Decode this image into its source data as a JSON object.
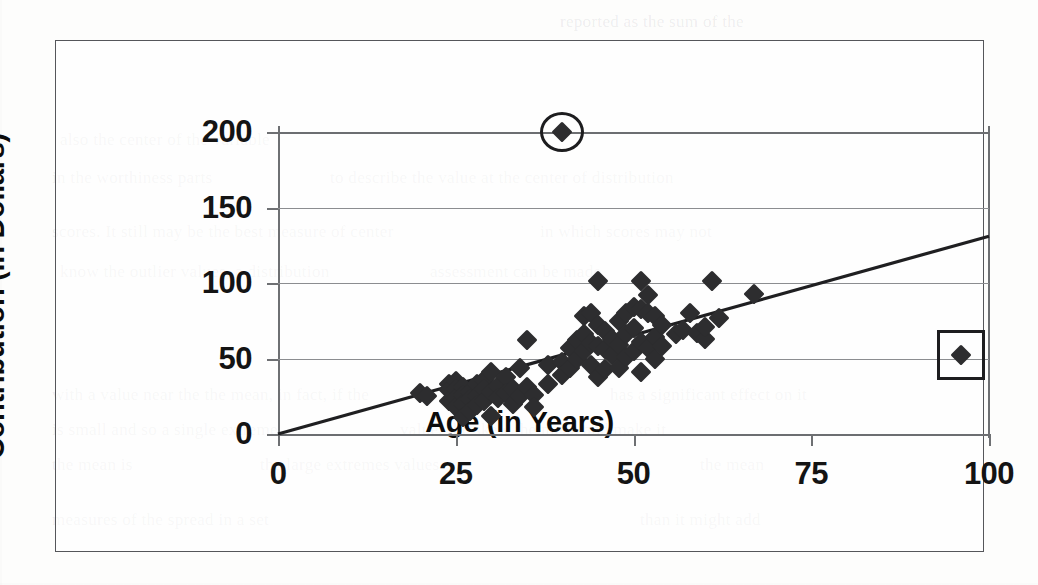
{
  "figure": {
    "frame_color": "#55565a",
    "background_color": "#fdfdfc"
  },
  "ghost_text": [
    {
      "text": "reported as the sum of the",
      "x": 560,
      "y": 12
    },
    {
      "text": "also the center of the variable",
      "x": 60,
      "y": 130
    },
    {
      "text": "in the worthiness parts",
      "x": 52,
      "y": 168
    },
    {
      "text": "to describe the value at the center of distribution",
      "x": 330,
      "y": 168
    },
    {
      "text": "scores. It still may be the best measure of center",
      "x": 52,
      "y": 222
    },
    {
      "text": "in which scores may not",
      "x": 540,
      "y": 222
    },
    {
      "text": "know the outlier values, a distribution",
      "x": 60,
      "y": 262
    },
    {
      "text": "assessment can be made",
      "x": 430,
      "y": 262
    },
    {
      "text": "with a value near the the mean, in fact, if the",
      "x": 52,
      "y": 385
    },
    {
      "text": "has a significant effect on it",
      "x": 610,
      "y": 385
    },
    {
      "text": "is small and so a single extreme",
      "x": 52,
      "y": 420
    },
    {
      "text": "value; the skew the mean and make it",
      "x": 400,
      "y": 420
    },
    {
      "text": "the mean is",
      "x": 52,
      "y": 455
    },
    {
      "text": "the large extremes values",
      "x": 260,
      "y": 455
    },
    {
      "text": "the mean",
      "x": 700,
      "y": 455
    },
    {
      "text": "measures of the spread in a set",
      "x": 52,
      "y": 510
    },
    {
      "text": "than it might add",
      "x": 640,
      "y": 510
    }
  ],
  "chart_data": {
    "type": "scatter",
    "title": "",
    "xlabel": "Age (in Years)",
    "ylabel": "Contribution (in Dollars)",
    "xlim": [
      0,
      100
    ],
    "ylim": [
      0,
      200
    ],
    "xticks": [
      0,
      25,
      50,
      75,
      100
    ],
    "yticks": [
      0,
      50,
      100,
      150,
      200
    ],
    "xtick_labels": [
      "0",
      "25",
      "50",
      "75",
      "100"
    ],
    "ytick_labels": [
      "0",
      "50",
      "100",
      "150",
      "200"
    ],
    "grid": "horizontal",
    "legend": "none",
    "marker": "diamond",
    "marker_color": "#2d2d2f",
    "points": [
      [
        20,
        27
      ],
      [
        21,
        25
      ],
      [
        24,
        33
      ],
      [
        24,
        29
      ],
      [
        24,
        22
      ],
      [
        25,
        35
      ],
      [
        25,
        30
      ],
      [
        25,
        24
      ],
      [
        25,
        18
      ],
      [
        26,
        31
      ],
      [
        26,
        26
      ],
      [
        26,
        20
      ],
      [
        26,
        11
      ],
      [
        27,
        28
      ],
      [
        27,
        23
      ],
      [
        27,
        15
      ],
      [
        28,
        33
      ],
      [
        28,
        25
      ],
      [
        28,
        19
      ],
      [
        29,
        36
      ],
      [
        29,
        30
      ],
      [
        29,
        22
      ],
      [
        30,
        41
      ],
      [
        30,
        28
      ],
      [
        30,
        12
      ],
      [
        31,
        32
      ],
      [
        31,
        24
      ],
      [
        32,
        38
      ],
      [
        32,
        27
      ],
      [
        33,
        30
      ],
      [
        33,
        20
      ],
      [
        34,
        44
      ],
      [
        34,
        25
      ],
      [
        35,
        62
      ],
      [
        35,
        31
      ],
      [
        36,
        26
      ],
      [
        36,
        18
      ],
      [
        38,
        46
      ],
      [
        38,
        33
      ],
      [
        40,
        48
      ],
      [
        40,
        39
      ],
      [
        41,
        57
      ],
      [
        41,
        44
      ],
      [
        42,
        62
      ],
      [
        42,
        50
      ],
      [
        43,
        78
      ],
      [
        43,
        66
      ],
      [
        43,
        55
      ],
      [
        44,
        80
      ],
      [
        44,
        60
      ],
      [
        44,
        46
      ],
      [
        45,
        101
      ],
      [
        45,
        72
      ],
      [
        45,
        58
      ],
      [
        45,
        38
      ],
      [
        46,
        68
      ],
      [
        46,
        56
      ],
      [
        46,
        43
      ],
      [
        47,
        63
      ],
      [
        47,
        52
      ],
      [
        48,
        75
      ],
      [
        48,
        59
      ],
      [
        48,
        44
      ],
      [
        49,
        80
      ],
      [
        49,
        66
      ],
      [
        49,
        51
      ],
      [
        50,
        84
      ],
      [
        50,
        70
      ],
      [
        50,
        55
      ],
      [
        51,
        101
      ],
      [
        51,
        83
      ],
      [
        51,
        61
      ],
      [
        51,
        41
      ],
      [
        52,
        92
      ],
      [
        52,
        80
      ],
      [
        52,
        57
      ],
      [
        53,
        78
      ],
      [
        53,
        64
      ],
      [
        53,
        50
      ],
      [
        54,
        72
      ],
      [
        54,
        58
      ],
      [
        56,
        66
      ],
      [
        57,
        69
      ],
      [
        58,
        80
      ],
      [
        59,
        67
      ],
      [
        60,
        63
      ],
      [
        60,
        71
      ],
      [
        61,
        101
      ],
      [
        62,
        77
      ],
      [
        67,
        93
      ],
      [
        40,
        200
      ],
      [
        96,
        52
      ]
    ],
    "annotations": [
      {
        "name": "circled-outlier",
        "shape": "circle",
        "x": 40,
        "y": 200,
        "width_px": 44,
        "height_px": 40,
        "description": "circled high outlier at age 40, contribution 200"
      },
      {
        "name": "boxed-outlier",
        "shape": "rect",
        "x": 96,
        "y": 52,
        "width_px": 48,
        "height_px": 50,
        "description": "boxed high-age outlier at age 96, contribution 52"
      }
    ],
    "trendline": {
      "type": "linear",
      "x_start": 0,
      "y_start": 0,
      "x_end": 100,
      "y_end": 131,
      "color": "#1f1f21"
    }
  }
}
